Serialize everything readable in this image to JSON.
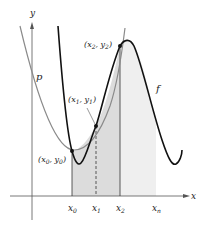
{
  "figure": {
    "axes": {
      "x_label": "x",
      "y_label": "y"
    },
    "curves": {
      "f": {
        "label": "f",
        "color": "#111111"
      },
      "p": {
        "label": "p",
        "color": "#8a8a8a"
      }
    },
    "points": [
      {
        "name": "x",
        "sub": "0",
        "name2": "y",
        "sub2": "0"
      },
      {
        "name": "x",
        "sub": "1",
        "name2": "y",
        "sub2": "1"
      },
      {
        "name": "x",
        "sub": "2",
        "name2": "y",
        "sub2": "2"
      }
    ],
    "ticks": [
      {
        "name": "x",
        "sub": "0"
      },
      {
        "name": "x",
        "sub": "1"
      },
      {
        "name": "x",
        "sub": "2"
      },
      {
        "name": "x",
        "sub": "n"
      }
    ],
    "colors": {
      "shade_dark": "#dcdcdc",
      "shade_light": "#eeeeee",
      "axis": "#555555"
    }
  }
}
